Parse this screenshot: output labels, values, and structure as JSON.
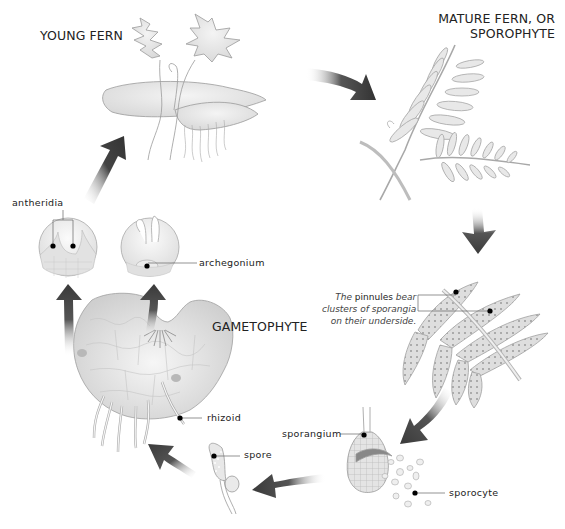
{
  "diagram": {
    "type": "life-cycle"
  },
  "stages": {
    "young_fern": {
      "title": "YOUNG FERN"
    },
    "mature_fern": {
      "title_line1": "MATURE FERN, OR",
      "title_line2": "SPOROPHYTE"
    },
    "gametophyte": {
      "title": "GAMETOPHYTE"
    }
  },
  "labels": {
    "antheridia": "antheridia",
    "archegonium": "archegonium",
    "rhizoid": "rhizoid",
    "spore": "spore",
    "sporangium": "sporangium",
    "sporocyte": "sporocyte"
  },
  "pinnule_note": {
    "line1_prefix": "The ",
    "line1_term": "pinnules",
    "line1_suffix": " bear",
    "line2": "clusters of sporangia",
    "line3": "on their underside."
  },
  "cycle_order": [
    "young fern",
    "mature fern, or sporophyte",
    "pinnules with sporangia",
    "sporangium releasing sporocytes",
    "spore",
    "gametophyte",
    "antheridia and archegonium",
    "young fern"
  ],
  "colors": {
    "arrow_dark": "#3a3a3a",
    "plant_fill": "#e6e6e6",
    "plant_stroke": "#9a9a9a",
    "text": "#222222"
  }
}
